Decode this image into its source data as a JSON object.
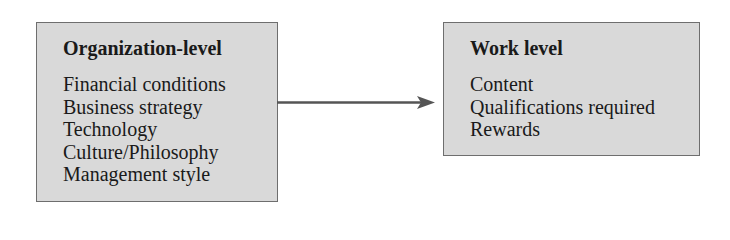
{
  "diagram": {
    "left_box": {
      "title": "Organization-level",
      "items": [
        "Financial conditions",
        "Business strategy",
        "Technology",
        "Culture/Philosophy",
        "Management style"
      ]
    },
    "right_box": {
      "title": "Work level",
      "items": [
        "Content",
        "Qualifications required",
        "Rewards"
      ]
    },
    "arrow": {
      "from": "left_box",
      "to": "right_box",
      "color": "#555555"
    },
    "colors": {
      "box_fill": "#d9d9d9",
      "box_border": "#6e6e6e",
      "text": "#1a1a1a"
    }
  }
}
